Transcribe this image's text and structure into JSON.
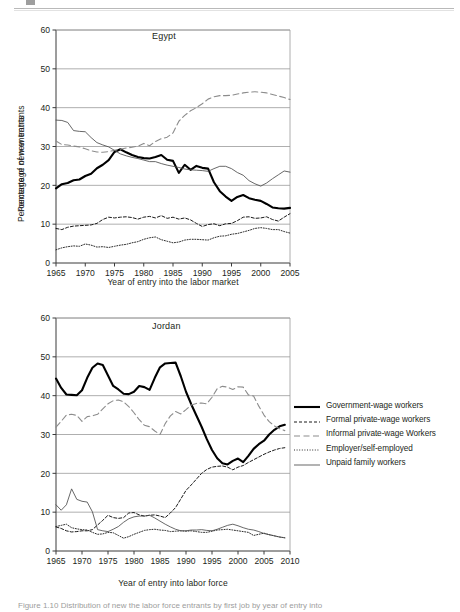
{
  "figure": {
    "caption": "Figure 1.10  Distribution of new the labor force entrants by first job by year of entry into"
  },
  "legend": {
    "position": "right",
    "items": [
      {
        "label": "Government-wage workers",
        "style": "solid-thick",
        "color": "#000000"
      },
      {
        "label": "Formal private-wage workers",
        "style": "dashed-short",
        "color": "#1a1a1a"
      },
      {
        "label": "Informal private-wage Workers",
        "style": "dashed-long",
        "color": "#8c8c8c"
      },
      {
        "label": "Employer/self-employed",
        "style": "dotted",
        "color": "#2b2b2b"
      },
      {
        "label": "Unpaid family workers",
        "style": "solid-thin",
        "color": "#4d4d4d"
      }
    ]
  },
  "chart_data": [
    {
      "type": "line",
      "title": "Egypt",
      "xlabel": "Year of entry into the labor market",
      "ylabel": "Percentage of new entrants",
      "xlim": [
        1965,
        2005
      ],
      "ylim": [
        0,
        60
      ],
      "ytick_labels": [
        "0",
        "10",
        "20",
        "30",
        "40",
        "50",
        "60"
      ],
      "yticks": [
        0,
        10,
        20,
        30,
        40,
        50,
        60
      ],
      "xtick_labels": [
        "1965",
        "1970",
        "1975",
        "1980",
        "1985",
        "1990",
        "1995",
        "2000",
        "2005"
      ],
      "xticks": [
        1965,
        1970,
        1975,
        1980,
        1985,
        1990,
        1995,
        2000,
        2005
      ],
      "grid": "horizontal",
      "x": [
        1965,
        1966,
        1967,
        1968,
        1969,
        1970,
        1971,
        1972,
        1973,
        1974,
        1975,
        1976,
        1977,
        1978,
        1979,
        1980,
        1981,
        1982,
        1983,
        1984,
        1985,
        1986,
        1987,
        1988,
        1989,
        1990,
        1991,
        1992,
        1993,
        1994,
        1995,
        1996,
        1997,
        1998,
        1999,
        2000,
        2001,
        2002,
        2003,
        2004,
        2005
      ],
      "series": [
        {
          "name": "Government-wage workers",
          "style": "solid-thick",
          "values": [
            19.2,
            20.3,
            20.6,
            21.3,
            21.5,
            22.4,
            23.0,
            24.4,
            25.3,
            26.5,
            28.6,
            29.3,
            28.5,
            27.8,
            27.3,
            27.0,
            26.9,
            27.3,
            27.8,
            26.6,
            26.3,
            23.2,
            25.3,
            24.0,
            25.0,
            24.5,
            24.3,
            20.8,
            18.5,
            17.1,
            16.0,
            17.0,
            17.5,
            16.7,
            16.3,
            16.0,
            15.2,
            14.3,
            14.1,
            14.0,
            14.2
          ]
        },
        {
          "name": "Formal private-wage workers",
          "style": "dashed-short",
          "values": [
            8.9,
            8.6,
            9.2,
            9.5,
            9.6,
            9.7,
            9.8,
            10.2,
            11.2,
            11.8,
            11.6,
            11.8,
            11.9,
            11.7,
            11.3,
            11.8,
            12.0,
            11.6,
            12.2,
            11.5,
            11.8,
            11.3,
            11.6,
            11.1,
            10.2,
            9.4,
            9.9,
            10.1,
            9.6,
            10.1,
            10.2,
            10.9,
            11.8,
            11.9,
            11.5,
            11.6,
            11.9,
            11.2,
            10.8,
            11.8,
            12.7
          ]
        },
        {
          "name": "Informal private-wage Workers",
          "style": "dashed-long",
          "values": [
            31.4,
            30.5,
            30.4,
            30.1,
            29.9,
            29.4,
            28.9,
            28.6,
            28.5,
            28.7,
            29.0,
            29.3,
            29.6,
            29.8,
            30.1,
            30.8,
            30.2,
            31.3,
            32.0,
            32.4,
            33.5,
            36.5,
            38.0,
            39.2,
            40.0,
            41.0,
            42.2,
            42.8,
            43.1,
            43.1,
            43.2,
            43.5,
            43.8,
            44.0,
            44.1,
            44.0,
            43.8,
            43.4,
            43.0,
            42.6,
            42.1
          ]
        },
        {
          "name": "Employer/self-employed",
          "style": "dotted",
          "values": [
            3.4,
            3.9,
            4.2,
            4.4,
            4.3,
            4.9,
            4.6,
            4.1,
            4.2,
            4.0,
            4.3,
            4.6,
            4.8,
            5.2,
            5.5,
            6.1,
            6.5,
            6.7,
            6.0,
            5.6,
            5.2,
            5.4,
            5.9,
            6.1,
            6.1,
            6.0,
            5.9,
            6.5,
            6.9,
            7.0,
            7.4,
            7.6,
            8.0,
            8.4,
            8.9,
            9.1,
            8.9,
            8.6,
            8.6,
            8.1,
            7.7
          ]
        },
        {
          "name": "Unpaid family workers",
          "style": "solid-thin",
          "values": [
            36.8,
            36.7,
            36.2,
            34.1,
            33.9,
            33.8,
            32.3,
            31.0,
            30.4,
            29.9,
            29.0,
            28.1,
            27.6,
            27.2,
            26.9,
            26.5,
            26.1,
            26.1,
            25.6,
            25.2,
            24.9,
            24.6,
            24.2,
            24.0,
            23.9,
            23.8,
            23.6,
            24.3,
            24.9,
            24.9,
            24.3,
            23.3,
            22.6,
            21.2,
            20.4,
            19.8,
            20.6,
            21.7,
            22.7,
            23.7,
            23.4
          ]
        }
      ]
    },
    {
      "type": "line",
      "title": "Jordan",
      "xlabel": "Year of entry into labor force",
      "ylabel": "Percentage of new entrants",
      "xlim": [
        1965,
        2010
      ],
      "ylim": [
        0,
        60
      ],
      "ytick_labels": [
        "0",
        "10",
        "20",
        "30",
        "40",
        "50",
        "60"
      ],
      "yticks": [
        0,
        10,
        20,
        30,
        40,
        50,
        60
      ],
      "xtick_labels": [
        "1965",
        "1970",
        "1975",
        "1980",
        "1985",
        "1990",
        "1995",
        "2000",
        "2005",
        "2010"
      ],
      "xticks": [
        1965,
        1970,
        1975,
        1980,
        1985,
        1990,
        1995,
        2000,
        2005,
        2010
      ],
      "grid": "horizontal",
      "x": [
        1965,
        1966,
        1967,
        1968,
        1969,
        1970,
        1971,
        1972,
        1973,
        1974,
        1975,
        1976,
        1977,
        1978,
        1979,
        1980,
        1981,
        1982,
        1983,
        1984,
        1985,
        1986,
        1987,
        1988,
        1989,
        1990,
        1991,
        1992,
        1993,
        1994,
        1995,
        1996,
        1997,
        1998,
        1999,
        2000,
        2001,
        2002,
        2003,
        2004,
        2005,
        2006,
        2007,
        2008,
        2009
      ],
      "series": [
        {
          "name": "Government-wage workers",
          "style": "solid-thick",
          "values": [
            44.4,
            42.0,
            40.3,
            40.2,
            40.1,
            41.4,
            44.6,
            47.2,
            48.3,
            47.9,
            45.2,
            42.5,
            41.6,
            40.5,
            40.4,
            41.0,
            42.5,
            42.2,
            41.5,
            44.6,
            47.3,
            48.3,
            48.4,
            48.5,
            45.0,
            41.0,
            37.8,
            34.9,
            32.0,
            28.8,
            26.0,
            23.9,
            22.6,
            22.3,
            23.2,
            23.8,
            22.9,
            24.5,
            26.3,
            27.5,
            28.4,
            30.0,
            31.2,
            32.1,
            32.5
          ]
        },
        {
          "name": "Formal private-wage workers",
          "style": "dashed-short",
          "values": [
            6.2,
            5.8,
            5.2,
            4.9,
            5.0,
            5.2,
            5.2,
            5.5,
            6.7,
            7.9,
            9.2,
            8.6,
            8.4,
            8.6,
            9.8,
            9.9,
            9.3,
            9.0,
            9.2,
            9.3,
            9.0,
            8.6,
            9.8,
            11.2,
            13.4,
            15.6,
            17.0,
            18.5,
            20.0,
            21.0,
            21.6,
            21.8,
            21.9,
            21.6,
            20.9,
            21.6,
            22.0,
            22.8,
            23.5,
            24.2,
            24.9,
            25.5,
            26.0,
            26.4,
            26.6
          ]
        },
        {
          "name": "Informal private-wage Workers",
          "style": "dashed-long",
          "values": [
            31.9,
            33.4,
            35.0,
            35.2,
            34.9,
            33.4,
            34.6,
            34.8,
            35.2,
            36.6,
            37.9,
            38.7,
            38.9,
            38.4,
            37.2,
            35.6,
            33.8,
            32.4,
            32.0,
            30.9,
            30.0,
            32.8,
            34.8,
            35.9,
            35.3,
            36.4,
            37.6,
            38.0,
            38.1,
            37.9,
            39.6,
            41.8,
            42.4,
            42.2,
            41.6,
            42.3,
            42.2,
            40.2,
            39.9,
            37.3,
            35.0,
            33.3,
            32.2,
            31.5,
            31.0
          ]
        },
        {
          "name": "Employer/self-employed",
          "style": "dotted",
          "values": [
            6.3,
            6.6,
            6.9,
            6.0,
            5.7,
            5.5,
            5.4,
            4.8,
            4.3,
            4.4,
            4.8,
            4.7,
            4.0,
            3.3,
            3.7,
            4.3,
            4.8,
            5.3,
            5.5,
            5.6,
            5.4,
            5.3,
            5.0,
            5.1,
            5.2,
            5.1,
            5.2,
            5.0,
            4.8,
            4.8,
            5.1,
            5.4,
            5.5,
            5.6,
            5.4,
            5.2,
            5.0,
            4.8,
            4.0,
            4.3,
            4.6,
            4.2,
            3.9,
            3.6,
            3.4
          ]
        },
        {
          "name": "Unpaid family workers",
          "style": "solid-thin",
          "values": [
            11.9,
            10.5,
            11.9,
            16.0,
            13.3,
            12.8,
            12.6,
            10.1,
            5.5,
            5.2,
            5.0,
            5.6,
            6.3,
            7.4,
            8.3,
            8.8,
            9.0,
            9.0,
            9.2,
            8.5,
            7.7,
            6.9,
            6.2,
            5.6,
            5.2,
            5.2,
            5.4,
            5.4,
            5.5,
            5.3,
            5.2,
            5.6,
            6.1,
            6.6,
            6.9,
            6.5,
            6.0,
            5.6,
            5.4,
            5.0,
            4.5,
            4.2,
            3.9,
            3.6,
            3.4
          ]
        }
      ]
    }
  ]
}
